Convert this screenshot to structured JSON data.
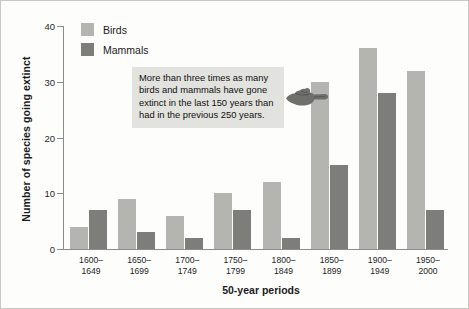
{
  "chart_data": {
    "type": "bar",
    "title": "",
    "xlabel": "50-year periods",
    "ylabel": "Number of species going extinct",
    "ylim": [
      0,
      40
    ],
    "yticks": [
      0,
      10,
      20,
      30,
      40
    ],
    "grid": false,
    "legend_position": "top-left",
    "categories": [
      "1600–1649",
      "1650–1699",
      "1700–1749",
      "1750–1799",
      "1800–1849",
      "1850–1899",
      "1900–1949",
      "1950–2000"
    ],
    "series": [
      {
        "name": "Birds",
        "color": "#b4b4b0",
        "values": [
          4,
          9,
          6,
          10,
          12,
          30,
          36,
          32
        ]
      },
      {
        "name": "Mammals",
        "color": "#7d7d79",
        "values": [
          7,
          3,
          2,
          7,
          2,
          15,
          28,
          7
        ]
      }
    ],
    "annotations": [
      {
        "text": "More than three times as many birds and mammals have gone extinct in the last 150 years than had in the previous 250 years.",
        "background": "#e2e2de"
      }
    ]
  }
}
